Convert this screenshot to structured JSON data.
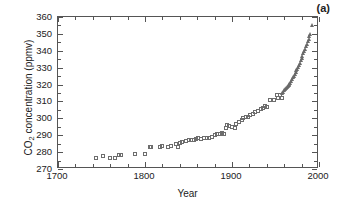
{
  "figure": {
    "panel_label": "(a)",
    "xlabel": "Year",
    "ylabel_main": "CO",
    "ylabel_sub": "2",
    "ylabel_rest": " concentration (ppmv)"
  },
  "chart_data": {
    "type": "scatter",
    "title": "",
    "panel_label": "(a)",
    "xlabel": "Year",
    "ylabel": "CO2 concentration (ppmv)",
    "xlim": [
      1700,
      2000
    ],
    "ylim": [
      270,
      360
    ],
    "xticks": [
      1700,
      1800,
      1900,
      2000
    ],
    "xtick_labels": [
      "1700",
      "1800",
      "1900",
      "2000"
    ],
    "xminor_step": 20,
    "yticks": [
      270,
      280,
      290,
      300,
      310,
      320,
      330,
      340,
      350,
      360
    ],
    "ytick_labels": [
      "270",
      "280",
      "290",
      "300",
      "310",
      "320",
      "330",
      "340",
      "350",
      "360"
    ],
    "grid": false,
    "legend": "none",
    "series": [
      {
        "name": "ice core (open squares)",
        "marker": "square-open",
        "color": "#6d6d6d",
        "points": [
          [
            1744,
            276.5
          ],
          [
            1752,
            277.5
          ],
          [
            1760,
            276.7
          ],
          [
            1765,
            276.8
          ],
          [
            1770,
            278.2
          ],
          [
            1772,
            278.1
          ],
          [
            1789,
            279.0
          ],
          [
            1800,
            278.9
          ],
          [
            1806,
            283.2
          ],
          [
            1807,
            283.0
          ],
          [
            1817,
            283.0
          ],
          [
            1820,
            283.6
          ],
          [
            1827,
            283.3
          ],
          [
            1830,
            283.5
          ],
          [
            1836,
            284.9
          ],
          [
            1838,
            282.8
          ],
          [
            1840,
            285.5
          ],
          [
            1843,
            286.0
          ],
          [
            1847,
            286.7
          ],
          [
            1850,
            287.0
          ],
          [
            1853,
            287.3
          ],
          [
            1856,
            287.2
          ],
          [
            1859,
            288.0
          ],
          [
            1861,
            288.6
          ],
          [
            1864,
            288.0
          ],
          [
            1868,
            288.5
          ],
          [
            1871,
            288.3
          ],
          [
            1874,
            288.6
          ],
          [
            1877,
            289.1
          ],
          [
            1880,
            290.0
          ],
          [
            1883,
            290.7
          ],
          [
            1886,
            291.0
          ],
          [
            1889,
            291.2
          ],
          [
            1891,
            291.0
          ],
          [
            1893,
            294.5
          ],
          [
            1894,
            296.0
          ],
          [
            1896,
            295.5
          ],
          [
            1900,
            295.0
          ],
          [
            1903,
            294.2
          ],
          [
            1905,
            296.5
          ],
          [
            1908,
            298.0
          ],
          [
            1911,
            299.2
          ],
          [
            1913,
            300.0
          ],
          [
            1916,
            300.6
          ],
          [
            1918,
            301.0
          ],
          [
            1921,
            302.0
          ],
          [
            1924,
            302.8
          ],
          [
            1927,
            304.0
          ],
          [
            1930,
            304.5
          ],
          [
            1933,
            305.5
          ],
          [
            1936,
            306.4
          ],
          [
            1938,
            307.5
          ],
          [
            1940,
            307.0
          ],
          [
            1944,
            310.8
          ],
          [
            1948,
            311.0
          ],
          [
            1952,
            313.8
          ],
          [
            1953,
            312.0
          ],
          [
            1955,
            313.6
          ],
          [
            1957,
            311.8
          ],
          [
            1958,
            312.2
          ]
        ]
      },
      {
        "name": "Mauna Loa (open triangles)",
        "marker": "triangle-open",
        "color": "#6a6a6a",
        "points": [
          [
            1958,
            315.0
          ],
          [
            1959,
            315.8
          ],
          [
            1960,
            316.5
          ],
          [
            1961,
            317.2
          ],
          [
            1962,
            317.9
          ],
          [
            1963,
            318.3
          ],
          [
            1964,
            318.9
          ],
          [
            1965,
            319.5
          ],
          [
            1966,
            320.5
          ],
          [
            1967,
            321.2
          ],
          [
            1968,
            322.0
          ],
          [
            1969,
            323.0
          ],
          [
            1970,
            324.2
          ],
          [
            1971,
            325.2
          ],
          [
            1972,
            326.0
          ],
          [
            1973,
            327.3
          ],
          [
            1974,
            328.4
          ],
          [
            1975,
            329.5
          ],
          [
            1976,
            330.5
          ],
          [
            1977,
            331.8
          ],
          [
            1978,
            333.0
          ],
          [
            1979,
            334.4
          ],
          [
            1980,
            335.8
          ],
          [
            1981,
            337.0
          ],
          [
            1982,
            338.4
          ],
          [
            1983,
            339.8
          ],
          [
            1984,
            341.2
          ],
          [
            1985,
            342.6
          ],
          [
            1986,
            344.0
          ],
          [
            1987,
            345.6
          ],
          [
            1988,
            347.2
          ],
          [
            1989,
            348.8
          ],
          [
            1990,
            350.2
          ],
          [
            1992,
            355.5
          ]
        ]
      }
    ]
  }
}
